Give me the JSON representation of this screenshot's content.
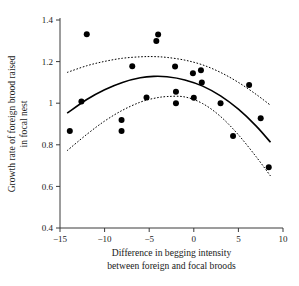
{
  "chart_data": {
    "type": "scatter",
    "title": "",
    "xlabel": "Difference in begging intensity between foreign and focal broods",
    "xlabel_line1": "Difference in begging intensity",
    "xlabel_line2": "between foreign and focal broods",
    "ylabel": "Growth rate of foreign brood raised in focal nest",
    "ylabel_line1": "Growth rate of foreign brood raised",
    "ylabel_line2": "in focal nest",
    "xlim": [
      -15,
      10
    ],
    "ylim": [
      0.4,
      1.4
    ],
    "xticks": [
      -15,
      -10,
      -5,
      0,
      5,
      10
    ],
    "xtick_labels": [
      "−15",
      "−10",
      "−5",
      "0",
      "5",
      "10"
    ],
    "yticks": [
      0.4,
      0.6,
      0.8,
      1.0,
      1.2,
      1.4
    ],
    "ytick_labels": [
      "0.4",
      "0.6",
      "0.8",
      "1",
      "1.2",
      "1.4"
    ],
    "grid": false,
    "legend": null,
    "point_color": "#000000",
    "curve_color": "#000000",
    "points": [
      {
        "x": -13.9,
        "y": 0.866
      },
      {
        "x": -12.6,
        "y": 1.008
      },
      {
        "x": -12.0,
        "y": 1.331
      },
      {
        "x": -8.1,
        "y": 0.919
      },
      {
        "x": -8.1,
        "y": 0.866
      },
      {
        "x": -6.9,
        "y": 1.178
      },
      {
        "x": -5.3,
        "y": 1.028
      },
      {
        "x": -4.0,
        "y": 1.33
      },
      {
        "x": -4.2,
        "y": 1.299
      },
      {
        "x": -2.1,
        "y": 1.176
      },
      {
        "x": -2.0,
        "y": 1.055
      },
      {
        "x": -2.0,
        "y": 1.0
      },
      {
        "x": -0.1,
        "y": 1.144
      },
      {
        "x": 0.0,
        "y": 1.026
      },
      {
        "x": 0.8,
        "y": 1.158
      },
      {
        "x": 0.9,
        "y": 1.1
      },
      {
        "x": 3.0,
        "y": 1.0
      },
      {
        "x": 4.4,
        "y": 0.842
      },
      {
        "x": 6.2,
        "y": 1.088
      },
      {
        "x": 7.5,
        "y": 0.928
      },
      {
        "x": 8.4,
        "y": 0.692
      }
    ],
    "fit_curve": {
      "label": "quadratic fit",
      "style": "solid",
      "x": [
        -14.2,
        -12,
        -10,
        -8,
        -6,
        -4.5,
        -3,
        -1,
        1,
        3,
        5,
        7,
        8.6
      ],
      "y": [
        0.952,
        1.018,
        1.065,
        1.1,
        1.122,
        1.129,
        1.127,
        1.112,
        1.082,
        1.035,
        0.971,
        0.89,
        0.812
      ]
    },
    "upper_ci": {
      "label": "upper confidence band",
      "style": "dashed",
      "x": [
        -14.2,
        -12,
        -10,
        -8,
        -6,
        -4.5,
        -3,
        -1,
        1,
        3,
        5,
        7,
        8.6
      ],
      "y": [
        1.148,
        1.18,
        1.201,
        1.216,
        1.223,
        1.224,
        1.22,
        1.207,
        1.184,
        1.148,
        1.1,
        1.042,
        0.99
      ]
    },
    "lower_ci": {
      "label": "lower confidence band",
      "style": "dashed",
      "x": [
        -14.2,
        -12,
        -10,
        -8,
        -6,
        -4.5,
        -3,
        -1,
        1,
        3,
        5,
        7,
        8.6
      ],
      "y": [
        0.772,
        0.85,
        0.914,
        0.966,
        1.005,
        1.023,
        1.032,
        1.03,
        0.998,
        0.936,
        0.848,
        0.742,
        0.65
      ]
    }
  }
}
